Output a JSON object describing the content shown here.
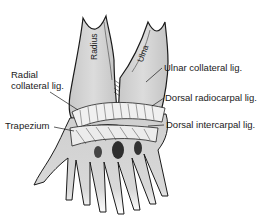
{
  "diagram": {
    "bones": {
      "radius": "Radius",
      "ulna": "Ulna"
    },
    "labels": {
      "radial_collateral_line1": "Radial",
      "radial_collateral_line2": "collateral lig.",
      "trapezium": "Trapezium",
      "ulnar_collateral": "Ulnar collateral lig.",
      "dorsal_radiocarpal": "Dorsal radiocarpal lig.",
      "dorsal_intercarpal": "Dorsal intercarpal lig."
    },
    "colors": {
      "bone_fill": "#d4d4d4",
      "outline": "#1a1a1a",
      "ligament": "#f2f2f2",
      "shadow": "#3a3a3a",
      "background": "#ffffff"
    }
  }
}
